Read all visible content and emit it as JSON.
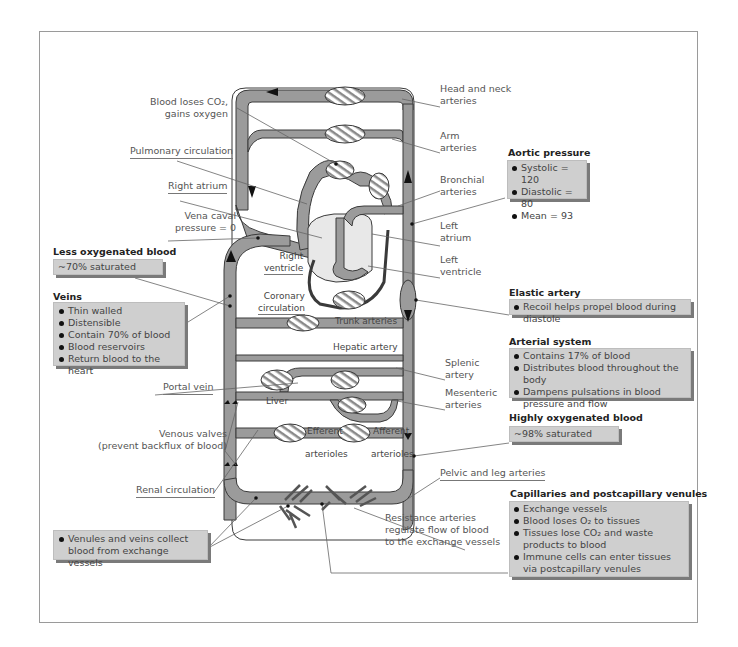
{
  "colors": {
    "vessel": "#9b9b9b",
    "vessel_stroke": "#3a3a3a",
    "box_fill": "#cfcfcf",
    "box_shadow": "#7a7a7a",
    "label_text": "#555555",
    "header_text": "#222222"
  },
  "diagram": {
    "left_labels": {
      "blood_loses_co2_line1": "Blood loses CO₂,",
      "blood_loses_co2_line2": "gains oxygen",
      "pulmonary_circulation": "Pulmonary circulation",
      "right_atrium": "Right atrium",
      "vena_caval_line1": "Vena caval",
      "vena_caval_line2": "pressure = 0",
      "portal_vein": "Portal vein",
      "venous_valves_line1": "Venous valves",
      "venous_valves_line2": "(prevent backflux of blood)",
      "renal_circulation": "Renal circulation"
    },
    "right_labels": {
      "head_neck_line1": "Head and neck",
      "head_neck_line2": "arteries",
      "arm_line1": "Arm",
      "arm_line2": "arteries",
      "bronchial_line1": "Bronchial",
      "bronchial_line2": "arteries",
      "left_atrium_line1": "Left",
      "left_atrium_line2": "atrium",
      "left_ventricle_line1": "Left",
      "left_ventricle_line2": "ventricle",
      "splenic_line1": "Splenic",
      "splenic_line2": "artery",
      "mesenteric_line1": "Mesenteric",
      "mesenteric_line2": "arteries",
      "pelvic_leg": "Pelvic and leg arteries",
      "resistance_line1": "Resistance arteries",
      "resistance_line2": "regulate flow of blood",
      "resistance_line3": "to the exchange vessels"
    },
    "inner_labels": {
      "right_ventricle_line1": "Right",
      "right_ventricle_line2": "ventricle",
      "coronary_line1": "Coronary",
      "coronary_line2": "circulation",
      "trunk_arteries": "Trunk arteries",
      "hepatic_artery": "Hepatic artery",
      "liver": "Liver",
      "efferent": "Efferent",
      "afferent": "Afferent",
      "arterioles_1": "arterioles",
      "arterioles_2": "arterioles"
    },
    "boxes": {
      "less_oxygenated": {
        "header": "Less oxygenated blood",
        "text": "~70% saturated"
      },
      "veins": {
        "header": "Veins",
        "items": [
          "Thin walled",
          "Distensible",
          "Contain 70% of blood",
          "Blood reservoirs",
          "Return blood to the heart"
        ]
      },
      "venules": {
        "items": [
          "Venules and veins collect blood from exchange vessels"
        ]
      },
      "aortic_pressure": {
        "header": "Aortic pressure",
        "items": [
          "Systolic = 120",
          "Diastolic = 80",
          "Mean = 93"
        ]
      },
      "elastic_artery": {
        "header": "Elastic artery",
        "items": [
          "Recoil helps propel blood during diastole"
        ]
      },
      "arterial_system": {
        "header": "Arterial system",
        "items": [
          "Contains 17% of blood",
          "Distributes blood throughout the body",
          "Dampens pulsations in blood pressure and flow"
        ]
      },
      "highly_oxygenated": {
        "header": "Highly oxygenated blood",
        "text": "~98% saturated"
      },
      "capillaries": {
        "header": "Capillaries and postcapillary venules",
        "items": [
          "Exchange vessels",
          "Blood loses O₂ to tissues",
          "Tissues lose CO₂ and waste products to blood",
          "Immune cells can enter tissues via postcapillary venules"
        ]
      }
    }
  }
}
